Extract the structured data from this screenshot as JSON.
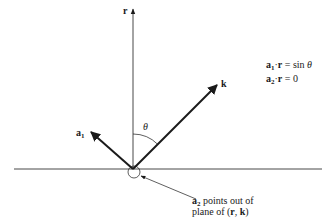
{
  "diagram": {
    "vectors": {
      "r": {
        "label": "r"
      },
      "k": {
        "label": "k"
      },
      "a1": {
        "label": "a",
        "subscript": "1"
      }
    },
    "angle": {
      "label": "θ"
    },
    "equations": [
      {
        "lhs_vec": "a",
        "lhs_sub": "1",
        "dot": "·",
        "rhs_vec": "r",
        "rest": " = sin ",
        "var": "θ"
      },
      {
        "lhs_vec": "a",
        "lhs_sub": "2",
        "dot": "·",
        "rhs_vec": "r",
        "rest": " = 0",
        "var": ""
      }
    ],
    "annotation": {
      "vec": "a",
      "sub": "2",
      "line1_rest": " points out of",
      "line2_prefix": "plane of (",
      "line2_v1": "r",
      "line2_sep": ", ",
      "line2_v2": "k",
      "line2_suffix": ")"
    },
    "colors": {
      "ink": "#1a1a1a",
      "background": "#ffffff"
    }
  }
}
